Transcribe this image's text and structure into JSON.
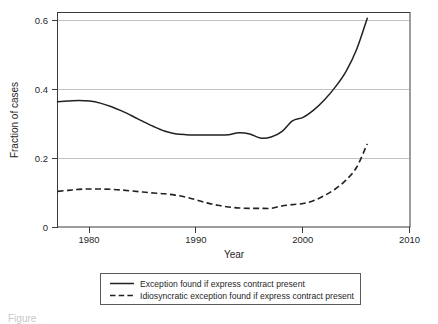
{
  "chart_data": {
    "type": "line",
    "title": "",
    "xlabel": "Year",
    "ylabel": "Fraction of cases",
    "xlim": [
      1977,
      2010
    ],
    "ylim": [
      0,
      0.632
    ],
    "grid": true,
    "legend_position": "below-plot",
    "xticks": [
      "1980",
      "1990",
      "2000",
      "2010"
    ],
    "xtick_values": [
      1980,
      1990,
      2000,
      2010
    ],
    "yticks": [
      "0",
      "0.2",
      "0.4",
      "0.6"
    ],
    "ytick_values": [
      0,
      0.2,
      0.4,
      0.6
    ],
    "x": [
      1977,
      1978,
      1979,
      1980,
      1981,
      1982,
      1983,
      1984,
      1985,
      1986,
      1987,
      1988,
      1989,
      1990,
      1991,
      1992,
      1993,
      1994,
      1995,
      1996,
      1997,
      1998,
      1999,
      2000,
      2001,
      2002,
      2003,
      2004,
      2005,
      2006
    ],
    "series": [
      {
        "name": "Exception found if express contract present",
        "style": "solid",
        "values": [
          0.369,
          0.371,
          0.373,
          0.371,
          0.365,
          0.355,
          0.342,
          0.327,
          0.311,
          0.296,
          0.283,
          0.275,
          0.272,
          0.271,
          0.271,
          0.271,
          0.272,
          0.278,
          0.274,
          0.262,
          0.265,
          0.281,
          0.313,
          0.323,
          0.345,
          0.375,
          0.412,
          0.458,
          0.523,
          0.615
        ]
      },
      {
        "name": "Idiosyncratic exception found if express contract present",
        "style": "dashed",
        "values": [
          0.105,
          0.108,
          0.111,
          0.112,
          0.112,
          0.111,
          0.109,
          0.106,
          0.103,
          0.1,
          0.098,
          0.094,
          0.088,
          0.08,
          0.071,
          0.064,
          0.059,
          0.056,
          0.055,
          0.055,
          0.055,
          0.062,
          0.066,
          0.069,
          0.078,
          0.093,
          0.112,
          0.138,
          0.176,
          0.245
        ]
      }
    ]
  },
  "legend": {
    "entries": [
      {
        "label": "Exception found if express contract present",
        "style": "solid"
      },
      {
        "label": "Idiosyncratic exception found if express contract present",
        "style": "dashed"
      }
    ]
  },
  "caption": {
    "text": "Figure"
  }
}
